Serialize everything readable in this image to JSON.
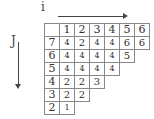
{
  "axes": {
    "horizontal_label": "i",
    "vertical_label": "J"
  },
  "header_row": [
    "",
    "1",
    "2",
    "3",
    "4",
    "5",
    "6"
  ],
  "rows": [
    {
      "j": "7",
      "values": [
        "4",
        "2",
        "4",
        "4",
        "6",
        "6"
      ]
    },
    {
      "j": "6",
      "values": [
        "4",
        "4",
        "4",
        "4",
        "5"
      ]
    },
    {
      "j": "5",
      "values": [
        "4",
        "4",
        "4",
        "4"
      ]
    },
    {
      "j": "4",
      "values": [
        "2",
        "2",
        "3"
      ]
    },
    {
      "j": "3",
      "values": [
        "2",
        "2"
      ]
    },
    {
      "j": "2",
      "values": [
        "1"
      ]
    }
  ]
}
